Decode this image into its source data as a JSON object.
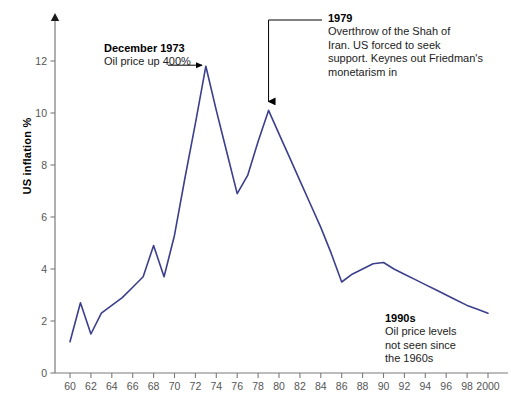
{
  "chart_data": {
    "type": "line",
    "title": "",
    "xlabel": "",
    "ylabel": "US inflation %",
    "xlim": [
      1960,
      2000
    ],
    "ylim": [
      0,
      13
    ],
    "ytick_step": 2,
    "xtick_step": 2,
    "grid": false,
    "legend": "none",
    "line_color": "#3b3f8c",
    "axis_color": "#7a7a7a",
    "series": [
      {
        "name": "US inflation %",
        "x": [
          1960,
          1961,
          1962,
          1963,
          1964,
          1965,
          1966,
          1967,
          1968,
          1969,
          1970,
          1971,
          1972,
          1973,
          1974,
          1975,
          1976,
          1977,
          1978,
          1979,
          1980,
          1981,
          1982,
          1983,
          1984,
          1985,
          1986,
          1987,
          1988,
          1989,
          1990,
          1991,
          1992,
          1993,
          1994,
          1995,
          1996,
          1997,
          1998,
          1999,
          2000
        ],
        "values": [
          1.2,
          2.7,
          1.5,
          2.3,
          2.6,
          2.9,
          3.3,
          3.7,
          4.9,
          3.7,
          5.3,
          7.5,
          9.6,
          11.8,
          10.1,
          8.5,
          6.9,
          7.6,
          8.9,
          10.1,
          9.2,
          8.3,
          7.4,
          6.5,
          5.6,
          4.6,
          3.5,
          3.8,
          4.0,
          4.2,
          4.25,
          4.0,
          3.8,
          3.6,
          3.4,
          3.2,
          3.0,
          2.8,
          2.6,
          2.45,
          2.3
        ]
      }
    ],
    "x_tick_labels": [
      "60",
      "62",
      "64",
      "66",
      "68",
      "70",
      "72",
      "74",
      "76",
      "78",
      "80",
      "82",
      "84",
      "86",
      "88",
      "90",
      "92",
      "94",
      "96",
      "98",
      "2000"
    ],
    "y_tick_labels": [
      "0",
      "2",
      "4",
      "6",
      "8",
      "10",
      "12"
    ],
    "annotations": [
      {
        "id": "1973",
        "heading": "December 1973",
        "body": "Oil price up 400%",
        "arrow": "horizontal-right",
        "points_to_year": 1973
      },
      {
        "id": "1979",
        "heading": "1979",
        "body": "Overthrow of the Shah of Iran. US forced to seek support. Keynes out Friedman's monetarism in",
        "arrow": "elbow-down",
        "points_to_year": 1979
      },
      {
        "id": "1990s",
        "heading": "1990s",
        "body": "Oil price levels not seen since the 1960s",
        "arrow": "none",
        "points_to_year": null
      }
    ]
  },
  "annotations": {
    "a1973": {
      "heading": "December 1973",
      "body": "Oil price up 400%"
    },
    "a1979": {
      "heading": "1979",
      "line1": "Overthrow of the Shah of",
      "line2": "Iran. US forced to seek",
      "line3": "support. Keynes out Friedman's",
      "line4": "monetarism in"
    },
    "a1990s": {
      "heading": "1990s",
      "line1": "Oil price levels",
      "line2": "not seen since",
      "line3": "the 1960s"
    }
  },
  "axes": {
    "y_axis_title": "US inflation %"
  }
}
